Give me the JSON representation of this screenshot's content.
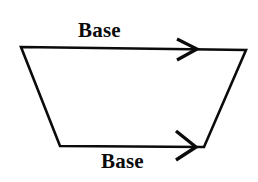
{
  "figure": {
    "background_color": "#ffffff",
    "stroke_color": "#0b0b0b",
    "stroke_width": 2.6,
    "labels": {
      "top_base": "Base",
      "bottom_base": "Base"
    },
    "shape": {
      "type": "trapezoid",
      "vertices": [
        {
          "name": "top-left",
          "x": 21,
          "y": 47
        },
        {
          "name": "top-right",
          "x": 246,
          "y": 50
        },
        {
          "name": "bottom-right",
          "x": 204,
          "y": 147
        },
        {
          "name": "bottom-left",
          "x": 60,
          "y": 146
        }
      ],
      "points_attr": "21,47 246,50 204,147 60,146"
    },
    "arrows": [
      {
        "name": "top-base-arrow",
        "tip_x": 197,
        "tip_y": 49,
        "upper_barb": "177,39",
        "lower_barb": "177,60",
        "direction": "right"
      },
      {
        "name": "bottom-base-arrow",
        "tip_x": 196,
        "tip_y": 147,
        "upper_barb": "176,131",
        "lower_barb": "176,160",
        "direction": "right"
      }
    ]
  }
}
